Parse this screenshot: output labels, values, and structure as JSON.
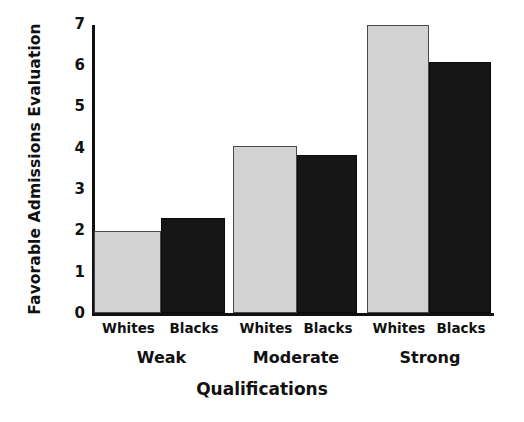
{
  "chart_data": {
    "type": "bar",
    "title": "",
    "xlabel": "Qualifications",
    "ylabel": "Favorable Admissions Evaluation",
    "categories": [
      "Weak",
      "Moderate",
      "Strong"
    ],
    "series": [
      {
        "name": "Whites",
        "values": [
          2.0,
          4.05,
          7.0
        ]
      },
      {
        "name": "Blacks",
        "values": [
          2.3,
          3.85,
          6.1
        ]
      }
    ],
    "ylim": [
      0,
      7
    ],
    "yticks": [
      0,
      1,
      2,
      3,
      4,
      5,
      6,
      7
    ],
    "ytick_labels": [
      "0",
      "1",
      "2",
      "3",
      "4",
      "5",
      "6",
      "7"
    ],
    "grid": false,
    "legend": "none",
    "series_colors": [
      "#d2d2d2",
      "#161616"
    ],
    "axis_color": "#111111",
    "background": "#ffffff"
  },
  "axis": {
    "y_title": "Favorable Admissions Evaluation",
    "x_title": "Qualifications"
  },
  "ticks": {
    "y": [
      "7",
      "6",
      "5",
      "4",
      "3",
      "2",
      "1",
      "0"
    ]
  },
  "groups": [
    {
      "label": "Weak",
      "bars": [
        {
          "series": "Whites",
          "value": 2.0
        },
        {
          "series": "Blacks",
          "value": 2.3
        }
      ]
    },
    {
      "label": "Moderate",
      "bars": [
        {
          "series": "Whites",
          "value": 4.05
        },
        {
          "series": "Blacks",
          "value": 3.85
        }
      ]
    },
    {
      "label": "Strong",
      "bars": [
        {
          "series": "Whites",
          "value": 7.0
        },
        {
          "series": "Blacks",
          "value": 6.1
        }
      ]
    }
  ]
}
